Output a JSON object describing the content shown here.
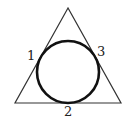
{
  "diagram": {
    "shapes": {
      "triangle": {
        "type": "equilateral-triangle",
        "stroke": "#333333"
      },
      "circle": {
        "type": "inscribed-circle",
        "stroke": "#111111"
      }
    },
    "labels": [
      {
        "id": "left",
        "text": "1"
      },
      {
        "id": "bottom",
        "text": "2"
      },
      {
        "id": "right",
        "text": "3"
      }
    ]
  }
}
